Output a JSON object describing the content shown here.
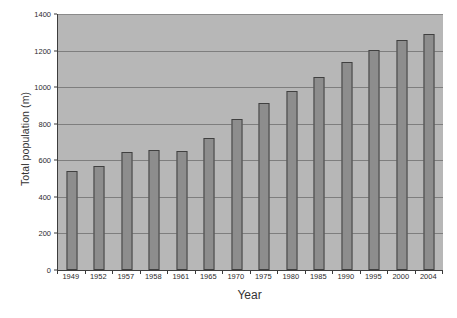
{
  "chart_data": {
    "type": "bar",
    "title": "",
    "xlabel": "Year",
    "ylabel": "Total population (m)",
    "categories": [
      "1949",
      "1952",
      "1957",
      "1958",
      "1961",
      "1965",
      "1970",
      "1975",
      "1980",
      "1985",
      "1990",
      "1995",
      "2000",
      "2004"
    ],
    "values": [
      540,
      570,
      645,
      655,
      650,
      720,
      825,
      915,
      980,
      1055,
      1135,
      1205,
      1260,
      1290
    ],
    "ylim": [
      0,
      1400
    ],
    "yticks": [
      0,
      200,
      400,
      600,
      800,
      1000,
      1200,
      1400
    ],
    "ytick_labels": [
      "0",
      "200",
      "400",
      "600",
      "800",
      "1000",
      "1200",
      "1400"
    ],
    "grid": true,
    "legend": false,
    "series": [
      {
        "name": "Total population (m)",
        "values": [
          540,
          570,
          645,
          655,
          650,
          720,
          825,
          915,
          980,
          1055,
          1135,
          1205,
          1260,
          1290
        ]
      }
    ],
    "colors": {
      "bar_fill": "#8d8d8d",
      "bar_border": "#404040",
      "plot_background": "#b7b7b7",
      "gridline": "#7e7e7e",
      "axis": "#3d3d3d",
      "text": "#2b2b2b",
      "page_background": "#ffffff"
    }
  },
  "axes": {
    "y_title": "Total population (m)",
    "x_title": "Year"
  }
}
